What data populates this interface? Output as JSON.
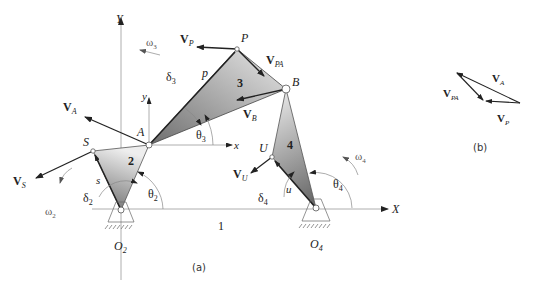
{
  "figure": {
    "part_a_caption": "(a)",
    "part_b_caption": "(b)",
    "colors": {
      "line": "#222222",
      "axis": "#999999",
      "link_fill_dark": "#7a7a7a",
      "link_fill_light": "#e6e6e6"
    }
  },
  "axes": {
    "X_label": "X",
    "Y_label": "Y",
    "x_label": "x",
    "y_label": "y",
    "ground_label": "1"
  },
  "points": {
    "A": "A",
    "B": "B",
    "P": "P",
    "S": "S",
    "U": "U",
    "O2": {
      "main": "O",
      "sub": "2"
    },
    "O4": {
      "main": "O",
      "sub": "4"
    }
  },
  "links": {
    "link2": "2",
    "link3": "3",
    "link4": "4"
  },
  "lengths": {
    "p": "p",
    "s": "s",
    "u": "u"
  },
  "angles": {
    "theta2": {
      "main": "θ",
      "sub": "2"
    },
    "theta3": {
      "main": "θ",
      "sub": "3"
    },
    "theta4": {
      "main": "θ",
      "sub": "4"
    },
    "delta2": {
      "main": "δ",
      "sub": "2"
    },
    "delta3": {
      "main": "δ",
      "sub": "3"
    },
    "delta4": {
      "main": "δ",
      "sub": "4"
    },
    "omega2": {
      "main": "ω",
      "sub": "2"
    },
    "omega3": {
      "main": "ω",
      "sub": "3"
    },
    "omega4": {
      "main": "ω",
      "sub": "4"
    }
  },
  "velocities": {
    "VA": {
      "main": "V",
      "sub": "A"
    },
    "VB": {
      "main": "V",
      "sub": "B"
    },
    "VP": {
      "main": "V",
      "sub": "P"
    },
    "VPA": {
      "main": "V",
      "sub": "PA"
    },
    "VS": {
      "main": "V",
      "sub": "S"
    },
    "VU": {
      "main": "V",
      "sub": "U"
    }
  },
  "polygon_b": {
    "VA": {
      "main": "V",
      "sub": "A"
    },
    "VPA": {
      "main": "V",
      "sub": "PA"
    },
    "VP": {
      "main": "V",
      "sub": "P"
    }
  }
}
